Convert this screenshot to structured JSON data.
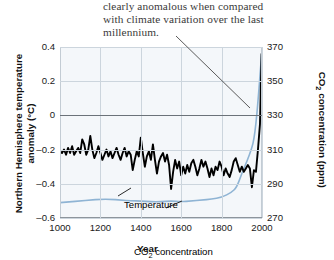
{
  "caption": {
    "lines": [
      "clearly anomalous when compared",
      "with climate variation over the last",
      "millennium."
    ]
  },
  "chart_data": {
    "type": "line",
    "title": "",
    "xlabel": "Year",
    "ylabel": "Northern Hemisphere temperature anomaly (°C)",
    "y2label": "CO2 concentration (ppm)",
    "xlim": [
      1000,
      2000
    ],
    "ylim": [
      -0.6,
      0.4
    ],
    "y2lim": [
      270,
      370
    ],
    "grid": true,
    "legend": "inline-labels",
    "xticks": [
      "1000",
      "1200",
      "1400",
      "1600",
      "1800",
      "2000"
    ],
    "xtick_values": [
      1000,
      1200,
      1400,
      1600,
      1800,
      2000
    ],
    "yticks": [
      "0.4",
      "0.2",
      "0",
      "-0.2",
      "-0.4",
      "-0.6"
    ],
    "ytick_values": [
      0.4,
      0.2,
      0,
      -0.2,
      -0.4,
      -0.6
    ],
    "y2ticks": [
      "370",
      "350",
      "330",
      "310",
      "290",
      "270"
    ],
    "y2tick_values": [
      370,
      350,
      330,
      310,
      290,
      270
    ],
    "series": [
      {
        "name": "Temperature",
        "label": "Temperature",
        "color": "#000000",
        "axis": "left",
        "units": "°C anomaly",
        "x": [
          1000,
          1010,
          1020,
          1030,
          1040,
          1050,
          1060,
          1070,
          1080,
          1090,
          1100,
          1110,
          1120,
          1130,
          1140,
          1150,
          1160,
          1170,
          1180,
          1190,
          1200,
          1210,
          1220,
          1230,
          1240,
          1250,
          1260,
          1270,
          1280,
          1290,
          1300,
          1310,
          1320,
          1330,
          1340,
          1350,
          1360,
          1370,
          1380,
          1390,
          1400,
          1410,
          1420,
          1430,
          1440,
          1450,
          1460,
          1470,
          1480,
          1490,
          1500,
          1510,
          1520,
          1530,
          1540,
          1550,
          1560,
          1570,
          1580,
          1590,
          1600,
          1610,
          1620,
          1630,
          1640,
          1650,
          1660,
          1670,
          1680,
          1690,
          1700,
          1710,
          1720,
          1730,
          1740,
          1750,
          1760,
          1770,
          1780,
          1790,
          1800,
          1810,
          1820,
          1830,
          1840,
          1850,
          1860,
          1870,
          1880,
          1890,
          1900,
          1910,
          1920,
          1930,
          1940,
          1950,
          1960,
          1970,
          1980,
          1990,
          1998
        ],
        "values": [
          -0.21,
          -0.22,
          -0.2,
          -0.23,
          -0.19,
          -0.22,
          -0.18,
          -0.23,
          -0.21,
          -0.19,
          -0.22,
          -0.14,
          -0.17,
          -0.23,
          -0.2,
          -0.12,
          -0.2,
          -0.25,
          -0.22,
          -0.18,
          -0.22,
          -0.26,
          -0.23,
          -0.2,
          -0.24,
          -0.21,
          -0.25,
          -0.22,
          -0.19,
          -0.23,
          -0.26,
          -0.22,
          -0.19,
          -0.24,
          -0.21,
          -0.23,
          -0.32,
          -0.26,
          -0.21,
          -0.24,
          -0.13,
          -0.22,
          -0.3,
          -0.24,
          -0.21,
          -0.26,
          -0.17,
          -0.26,
          -0.34,
          -0.27,
          -0.24,
          -0.22,
          -0.27,
          -0.23,
          -0.29,
          -0.43,
          -0.33,
          -0.26,
          -0.31,
          -0.27,
          -0.35,
          -0.3,
          -0.34,
          -0.29,
          -0.33,
          -0.28,
          -0.26,
          -0.3,
          -0.35,
          -0.31,
          -0.26,
          -0.3,
          -0.27,
          -0.31,
          -0.36,
          -0.31,
          -0.35,
          -0.3,
          -0.32,
          -0.27,
          -0.3,
          -0.35,
          -0.31,
          -0.34,
          -0.36,
          -0.32,
          -0.27,
          -0.25,
          -0.29,
          -0.33,
          -0.3,
          -0.33,
          -0.31,
          -0.29,
          -0.31,
          -0.42,
          -0.32,
          -0.33,
          -0.2,
          -0.05,
          0.36
        ]
      },
      {
        "name": "CO2 concentration",
        "label": "CO₂ concentration",
        "color": "#8fb4d4",
        "axis": "right",
        "units": "ppm",
        "x": [
          1000,
          1050,
          1100,
          1150,
          1200,
          1250,
          1300,
          1350,
          1400,
          1450,
          1500,
          1550,
          1600,
          1650,
          1700,
          1750,
          1800,
          1850,
          1875,
          1900,
          1925,
          1950,
          1960,
          1970,
          1980,
          1990,
          1998
        ],
        "values": [
          279,
          279.5,
          280,
          280.5,
          281,
          281,
          280.5,
          280,
          280,
          279.5,
          279.5,
          280,
          279.5,
          280,
          280.5,
          281,
          282,
          285,
          288,
          296,
          303,
          311,
          316,
          325,
          338,
          353,
          366
        ]
      }
    ],
    "annotations": [
      {
        "type": "leader-line",
        "from_xy_px": [
          176,
          36
        ],
        "to_xy_px": [
          250,
          108
        ],
        "color": "#5a5a5a"
      },
      {
        "type": "series-callout",
        "label": "Temperature",
        "leader": true
      },
      {
        "type": "series-callout",
        "label": "CO₂ concentration",
        "leader": true
      }
    ]
  },
  "colors": {
    "plot_background": "#f4f7fa",
    "gridline": "#ccd5dd",
    "zeroline": "#6b7279",
    "temperature_line": "#000000",
    "co2_line": "#8fb4d4",
    "leader_line": "#5a5a5a",
    "caption_text": "#3a3a3a"
  }
}
